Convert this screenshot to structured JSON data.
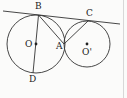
{
  "diagram": {
    "type": "geometry",
    "colors": {
      "stroke": "#333333",
      "background": "#fbfbfa"
    },
    "labels": {
      "B": "B",
      "C": "C",
      "A": "A",
      "O": "O",
      "O_prime": "O'",
      "D": "D"
    },
    "circles": [
      {
        "name": "O",
        "cx": 36,
        "cy": 44,
        "r": 29
      },
      {
        "name": "O'",
        "cx": 87,
        "cy": 44,
        "r": 23
      }
    ],
    "points": {
      "B": [
        38,
        15
      ],
      "C": [
        88,
        21
      ],
      "A": [
        64,
        44
      ],
      "O": [
        36,
        44
      ],
      "O_prime": [
        87,
        44
      ],
      "D": [
        33,
        73
      ]
    },
    "segments": [
      {
        "from": [
          3,
          11
        ],
        "to": [
          120,
          24
        ],
        "name": "tangent-line"
      },
      {
        "from": "B",
        "to": "D",
        "name": "diameter-BD"
      },
      {
        "from": "B",
        "to": "A",
        "name": "segment-BA"
      },
      {
        "from": "A",
        "to": "C",
        "name": "segment-AC"
      }
    ]
  }
}
